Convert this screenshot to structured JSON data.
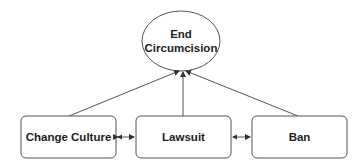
{
  "diagram": {
    "goal": {
      "label_line1": "End",
      "label_line2": "Circumcision"
    },
    "nodes": [
      {
        "id": "change-culture",
        "label": "Change Culture"
      },
      {
        "id": "lawsuit",
        "label": "Lawsuit"
      },
      {
        "id": "ban",
        "label": "Ban"
      }
    ],
    "edges": [
      {
        "from": "change-culture",
        "to": "end-circumcision",
        "type": "arrow"
      },
      {
        "from": "lawsuit",
        "to": "end-circumcision",
        "type": "arrow"
      },
      {
        "from": "ban",
        "to": "end-circumcision",
        "type": "arrow"
      },
      {
        "from": "change-culture",
        "to": "lawsuit",
        "type": "bidirectional"
      },
      {
        "from": "lawsuit",
        "to": "ban",
        "type": "bidirectional"
      }
    ],
    "colors": {
      "stroke": "#555555",
      "text": "#222222",
      "fill": "#ffffff"
    }
  }
}
